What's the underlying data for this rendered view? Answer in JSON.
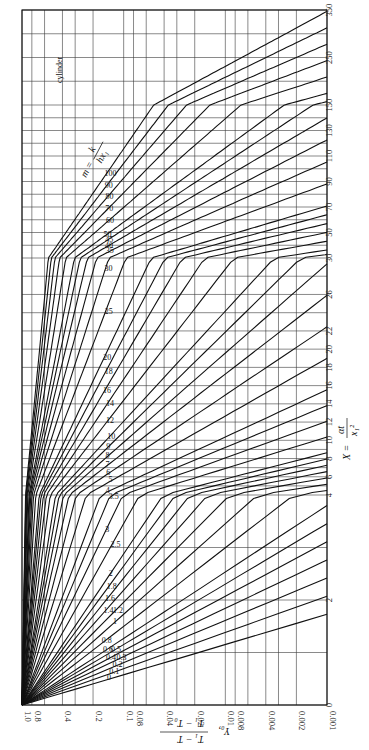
{
  "chart_data": {
    "type": "line",
    "title": "cylinder",
    "orientation": "rotated 90° clockwise",
    "xlabel": "X = αt / x1²",
    "ylabel": "Y0, (T1 - T)/(T1 - T0)",
    "parameter_label": "m = k / (h x1)",
    "yscale": "log",
    "ylim": [
      0.001,
      1.0
    ],
    "y_ticks": [
      "1.0",
      "0.8",
      "0.4",
      "0.2",
      "0.1",
      "0.08",
      "0.04",
      "0.02",
      "0.01",
      "0.008",
      "0.004",
      "0.002",
      "0.001"
    ],
    "x_ticks": [
      "0",
      "2",
      "4",
      "6",
      "8",
      "10",
      "12",
      "14",
      "16",
      "18",
      "20",
      "22",
      "26",
      "30",
      "50",
      "70",
      "90",
      "110",
      "130",
      "150",
      "250",
      "350"
    ],
    "xlim": [
      0,
      350
    ],
    "grid": true,
    "legend_position": "inline curve labels",
    "series": [
      {
        "name": "m=0",
        "m": 0
      },
      {
        "name": "m=0.1",
        "m": 0.1
      },
      {
        "name": "m=0.2",
        "m": 0.2
      },
      {
        "name": "m=0.3",
        "m": 0.3
      },
      {
        "name": "m=0.4",
        "m": 0.4
      },
      {
        "name": "m=0.5",
        "m": 0.5
      },
      {
        "name": "m=0.6",
        "m": 0.6
      },
      {
        "name": "m=0.8",
        "m": 0.8
      },
      {
        "name": "m=1.0",
        "m": 1.0
      },
      {
        "name": "m=1.2",
        "m": 1.2
      },
      {
        "name": "m=1.4",
        "m": 1.4
      },
      {
        "name": "m=1.6",
        "m": 1.6
      },
      {
        "name": "m=1.8",
        "m": 1.8
      },
      {
        "name": "m=2.0",
        "m": 2.0
      },
      {
        "name": "m=2.5",
        "m": 2.5
      },
      {
        "name": "m=3.0",
        "m": 3.0
      },
      {
        "name": "m=3.5",
        "m": 3.5
      },
      {
        "name": "m=4",
        "m": 4
      },
      {
        "name": "m=5",
        "m": 5
      },
      {
        "name": "m=6",
        "m": 6
      },
      {
        "name": "m=7",
        "m": 7
      },
      {
        "name": "m=8",
        "m": 8
      },
      {
        "name": "m=9",
        "m": 9
      },
      {
        "name": "m=10",
        "m": 10
      },
      {
        "name": "m=12",
        "m": 12
      },
      {
        "name": "m=14",
        "m": 14
      },
      {
        "name": "m=16",
        "m": 16
      },
      {
        "name": "m=18",
        "m": 18
      },
      {
        "name": "m=20",
        "m": 20
      },
      {
        "name": "m=25",
        "m": 25
      },
      {
        "name": "m=30",
        "m": 30
      },
      {
        "name": "m=35",
        "m": 35
      },
      {
        "name": "m=40",
        "m": 40
      },
      {
        "name": "m=45",
        "m": 45
      },
      {
        "name": "m=50",
        "m": 50
      },
      {
        "name": "m=60",
        "m": 60
      },
      {
        "name": "m=70",
        "m": 70
      },
      {
        "name": "m=80",
        "m": 80
      },
      {
        "name": "m=90",
        "m": 90
      },
      {
        "name": "m=100",
        "m": 100
      }
    ]
  },
  "labels": {
    "title": "cylinder",
    "x_axis": "X = αt / x1²",
    "y_axis": "Y0, (T1 − T)/(T1 − T0)",
    "parameter": "m = k/(h x1)"
  }
}
